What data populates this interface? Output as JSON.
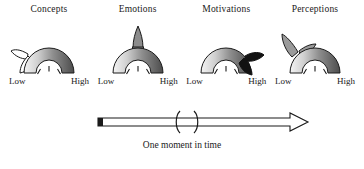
{
  "figure": {
    "title": "",
    "gauges": [
      {
        "label": "Concepts",
        "scale_low": "Low",
        "scale_high": "High",
        "appendage": "white-outlined-double-leaf-left",
        "appendage_fill": "#ffffff",
        "needle_reading": "mid"
      },
      {
        "label": "Emotions",
        "scale_low": "Low",
        "scale_high": "High",
        "appendage": "gray-spike-top",
        "appendage_fill": "#8c8c8c",
        "needle_reading": "mid"
      },
      {
        "label": "Motivations",
        "scale_low": "Low",
        "scale_high": "High",
        "appendage": "black-leaf-right",
        "appendage_fill": "#121212",
        "needle_reading": "mid"
      },
      {
        "label": "Perceptions",
        "scale_low": "Low",
        "scale_high": "High",
        "appendage": "gray-leaf-upper-left",
        "appendage_fill": "#9a9a9a",
        "needle_reading": "mid"
      }
    ],
    "timeline": {
      "caption": "One moment in time",
      "bracket_left": "(",
      "bracket_right": ")",
      "arrow_direction": "right"
    },
    "colors": {
      "arc_gradient_start": "#f2f2f2",
      "arc_gradient_end": "#4a4a4a",
      "stroke": "#1a1a1a",
      "text": "#1a1a1a",
      "background": "#ffffff"
    }
  }
}
